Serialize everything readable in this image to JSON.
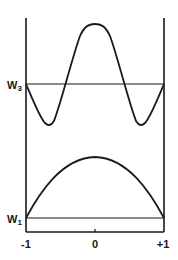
{
  "figure": {
    "type": "energy-level wavefunction diagram",
    "levels": [
      {
        "name": "W3",
        "label_main": "W",
        "label_sub": "3",
        "y": 84
      },
      {
        "name": "W1",
        "label_main": "W",
        "label_sub": "1",
        "y": 218
      }
    ],
    "x_axis": {
      "ticks": [
        {
          "label": "-1",
          "x": 26
        },
        {
          "label": "0",
          "x": 95
        },
        {
          "label": "+1",
          "x": 164
        }
      ]
    },
    "curves": [
      {
        "name": "wavefunction-level-3",
        "description": "Oscillating curve: peak at center, minima near x=±0.65, baseline W3 at edges"
      },
      {
        "name": "wavefunction-level-1",
        "description": "Single half-cosine arch above W1, maximum at x=0"
      }
    ],
    "colors": {
      "line": "#1a1a1a",
      "background": "#ffffff"
    }
  }
}
